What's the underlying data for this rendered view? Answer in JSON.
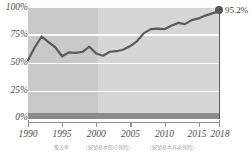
{
  "chart_data": {
    "type": "line",
    "title": "",
    "subtitle": "",
    "xlabel": "",
    "ylabel": "",
    "xlim": [
      1990,
      2018
    ],
    "ylim": [
      0,
      100
    ],
    "grid": true,
    "legend_position": "none",
    "y_ticks": [
      "0%",
      "25%",
      "50%",
      "75%",
      "100%"
    ],
    "y_tick_values": [
      0,
      25,
      50,
      75,
      100
    ],
    "x_ticks": [
      "1990",
      "1995",
      "2000",
      "2005",
      "2010",
      "2015",
      "2018"
    ],
    "x_tick_values": [
      1990,
      1995,
      2000,
      2005,
      2010,
      2015,
      2018
    ],
    "x": [
      1990,
      1991,
      1992,
      1993,
      1994,
      1995,
      1996,
      1997,
      1998,
      1999,
      2000,
      2001,
      2002,
      2003,
      2004,
      2005,
      2006,
      2007,
      2008,
      2009,
      2010,
      2011,
      2012,
      2013,
      2014,
      2015,
      2016,
      2017,
      2018
    ],
    "values": [
      52.0,
      63.5,
      73.0,
      68.0,
      63.5,
      55.5,
      59.0,
      58.5,
      59.5,
      64.0,
      58.0,
      56.0,
      59.5,
      60.0,
      61.5,
      64.5,
      69.0,
      76.0,
      79.5,
      80.0,
      79.5,
      82.5,
      85.0,
      84.0,
      87.5,
      89.0,
      91.5,
      93.5,
      95.2
    ],
    "series": [
      {
        "name": "coverage-rate",
        "values": [
          52.0,
          63.5,
          73.0,
          68.0,
          63.5,
          55.5,
          59.0,
          58.5,
          59.5,
          64.0,
          58.0,
          56.0,
          59.5,
          60.0,
          61.5,
          64.5,
          69.0,
          76.0,
          79.5,
          80.0,
          79.5,
          82.5,
          85.0,
          84.0,
          87.5,
          89.0,
          91.5,
          93.5,
          95.2
        ]
      }
    ],
    "annotations": [
      {
        "name": "endpoint-value",
        "x": 2018,
        "y": 95.2,
        "label": "95.2%"
      }
    ],
    "bands": [
      {
        "name": "early-period",
        "from": 1990,
        "to": 2000,
        "color": "#c9c9c9"
      },
      {
        "name": "late-period",
        "from": 2000,
        "to": 2018,
        "color": "#d6d6d6"
      }
    ],
    "colors": {
      "line": "#5a5a5a",
      "marker": "#575757",
      "gridline": "#fdfdfd",
      "band_early": "#c9c9c9",
      "band_late": "#d6d6d6",
      "baseline": "#8c8c8c",
      "axis": "#8e8e8e",
      "tick_label": "#4a4a4a"
    }
  },
  "axes": {
    "y_labels": [
      "100%",
      "75%",
      "50%",
      "25%",
      "0%"
    ],
    "x_labels": [
      "1990",
      "1995",
      "2000",
      "2005",
      "2010",
      "2015",
      "2018"
    ]
  },
  "annotation": {
    "endpoint_label": "95.2%"
  },
  "caption": {
    "cells": [
      "覆盖率",
      "（城镇基本医疗保险）",
      "（城镇基本养老保险）"
    ]
  }
}
